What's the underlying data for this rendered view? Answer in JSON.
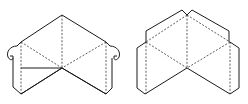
{
  "diagram": {
    "colors": {
      "line": "#1a1a1a",
      "fold": "#333333",
      "background": "#ffffff"
    },
    "figures": [
      {
        "id": "left-net",
        "variant": "with rounded tabs"
      },
      {
        "id": "right-net",
        "variant": "with straight flaps"
      }
    ]
  }
}
